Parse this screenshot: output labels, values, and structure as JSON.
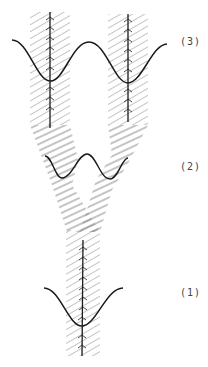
{
  "diagram": {
    "stages": [
      {
        "id": "stage-3",
        "label": "(3)",
        "description": "two-trough cosine wave with two vertical hatched bands and axes"
      },
      {
        "id": "stage-2",
        "label": "(2)",
        "description": "small wave with diagonal hatched bands merging"
      },
      {
        "id": "stage-1",
        "label": "(1)",
        "description": "single-trough wave with one vertical hatched band and axis"
      }
    ],
    "colors": {
      "line": "#1a1a1a",
      "hatch": "#8a8a8a",
      "background": "#ffffff"
    }
  }
}
